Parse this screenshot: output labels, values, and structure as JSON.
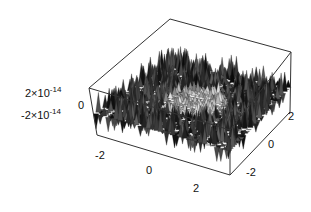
{
  "chart_data": {
    "type": "surface3d",
    "title": "",
    "x_axis": {
      "label": "",
      "range": [
        -3,
        3
      ],
      "ticks": [
        -2,
        0,
        2
      ],
      "tick_labels": [
        "-2",
        "0",
        "2"
      ]
    },
    "y_axis": {
      "label": "",
      "range": [
        -3,
        3
      ],
      "ticks": [
        2,
        0,
        -2
      ],
      "tick_labels": [
        "2",
        "0",
        "-2"
      ]
    },
    "z_axis": {
      "label": "",
      "range": [
        -3e-14,
        3e-14
      ],
      "ticks": [
        2e-14,
        0,
        -2e-14
      ],
      "tick_labels": [
        "2×10^-14",
        "0",
        "-2×10^-14"
      ]
    },
    "box": true,
    "grid": false,
    "colors": {
      "surface_dark": "#111111",
      "surface_light": "#d8d8d8",
      "box_line": "#333333"
    }
  },
  "labels": {
    "z_top": {
      "base": "2×10",
      "exp": "-14"
    },
    "z_mid": "0",
    "z_bot": {
      "base": "-2×10",
      "exp": "-14"
    },
    "x_ticks": [
      "-2",
      "0",
      "2"
    ],
    "y_ticks": [
      "2",
      "0",
      "-2"
    ]
  }
}
